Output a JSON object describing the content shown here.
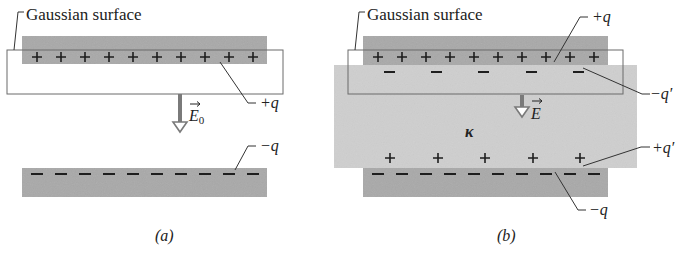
{
  "colors": {
    "plate": "#a9a9a9",
    "dielectric": "#cfcfcf",
    "gaussian_stroke": "#6b6b6b",
    "charge": "#1e1e1e",
    "arrow": "#7a7a7a",
    "text": "#222222"
  },
  "panel_a": {
    "caption": "(a)",
    "gaussian_label": "Gaussian surface",
    "top_plate_label": "+q",
    "bottom_plate_label": "−q",
    "field_label": "E",
    "field_subscript": "0",
    "top_charge_symbol": "+",
    "top_charge_count": 10,
    "bottom_charge_symbol": "−",
    "bottom_charge_count": 10
  },
  "panel_b": {
    "caption": "(b)",
    "gaussian_label": "Gaussian surface",
    "top_plate_label": "+q",
    "bottom_plate_label": "−q",
    "induced_top_label": "−q′",
    "induced_bottom_label": "+q′",
    "field_label": "E",
    "dielectric_label": "κ",
    "top_charge_count": 10,
    "bottom_charge_count": 10,
    "induced_charge_count": 5
  }
}
